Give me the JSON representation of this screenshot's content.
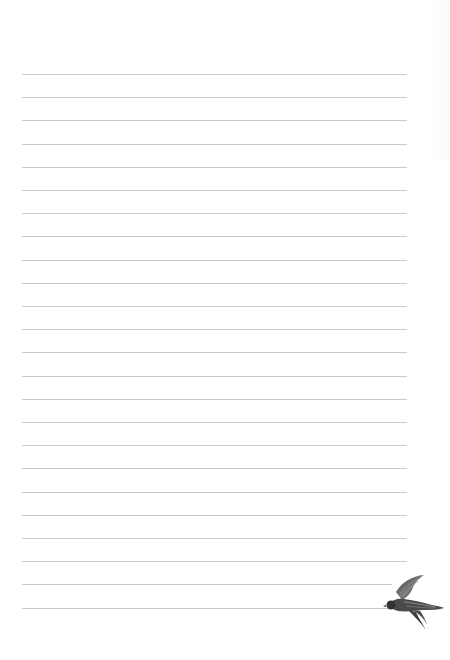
{
  "page": {
    "type": "lined-notepaper",
    "background": "#ffffff",
    "rule_color": "#c9c9c9",
    "rule_count": 24,
    "rule_left": 22,
    "rule_right": 407,
    "first_rule_y": 74,
    "rule_spacing": 23.2
  },
  "decoration": {
    "icon": "swallow-bird-icon",
    "color": "#4a4a4a"
  }
}
